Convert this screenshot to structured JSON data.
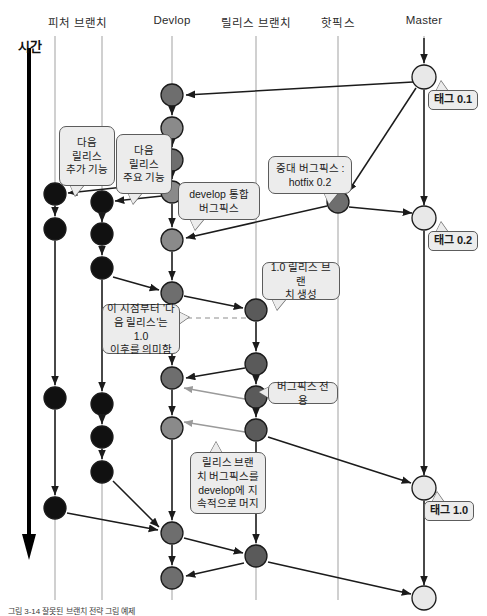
{
  "figure": {
    "caption": "그림 3-14 잘못된 브랜치 전략 그림 예제",
    "time_axis_label": "시간"
  },
  "lanes": [
    {
      "id": "feature",
      "label": "피처 브랜치",
      "x": 78,
      "label_x": 78,
      "line_x1": 55,
      "line_x2": 102
    },
    {
      "id": "develop",
      "label": "Devlop",
      "x": 172,
      "label_x": 172,
      "line_x1": 172,
      "line_x2": 172
    },
    {
      "id": "release",
      "label": "릴리스 브랜치",
      "x": 256,
      "label_x": 256,
      "line_x1": 256,
      "line_x2": 256
    },
    {
      "id": "hotfix",
      "label": "핫픽스",
      "x": 338,
      "label_x": 338,
      "line_x1": 338,
      "line_x2": 338
    },
    {
      "id": "master",
      "label": "Master",
      "x": 424,
      "label_x": 424,
      "line_x1": 424,
      "line_x2": 424
    }
  ],
  "lane_lines": [
    {
      "name": "lane-line-feature-a",
      "x": 55,
      "y1": 36,
      "y2": 600
    },
    {
      "name": "lane-line-feature-b",
      "x": 102,
      "y1": 36,
      "y2": 600
    },
    {
      "name": "lane-line-develop",
      "x": 172,
      "y1": 36,
      "y2": 600
    },
    {
      "name": "lane-line-release",
      "x": 256,
      "y1": 36,
      "y2": 600
    },
    {
      "name": "lane-line-hotfix",
      "x": 338,
      "y1": 36,
      "y2": 600
    },
    {
      "name": "lane-line-master",
      "x": 424,
      "y1": 36,
      "y2": 600
    }
  ],
  "colors": {
    "node_feature": "#111111",
    "node_develop": "#6e6e6e",
    "node_release": "#5a5a5a",
    "node_hotfix": "#6e6e6e",
    "node_master": "#e8e8e8",
    "edge": "#1b1b1b",
    "edge_light": "#9a9a9a",
    "lane_line": "#bcbcbc",
    "callout_bg": "#ececec",
    "callout_border": "#5c5c5c",
    "time_arrow": "#000000"
  },
  "nodes": [
    {
      "id": "f1",
      "lane": "feature",
      "x": 55,
      "y": 194,
      "r": 11,
      "fill": "#111111"
    },
    {
      "id": "f2",
      "lane": "feature",
      "x": 55,
      "y": 229,
      "r": 11,
      "fill": "#111111"
    },
    {
      "id": "f3",
      "lane": "feature",
      "x": 55,
      "y": 398,
      "r": 11,
      "fill": "#111111"
    },
    {
      "id": "f4",
      "lane": "feature",
      "x": 55,
      "y": 508,
      "r": 11,
      "fill": "#111111"
    },
    {
      "id": "g1",
      "lane": "feature",
      "x": 102,
      "y": 202,
      "r": 11,
      "fill": "#111111"
    },
    {
      "id": "g2",
      "lane": "feature",
      "x": 102,
      "y": 234,
      "r": 11,
      "fill": "#111111"
    },
    {
      "id": "g3",
      "lane": "feature",
      "x": 102,
      "y": 268,
      "r": 11,
      "fill": "#111111"
    },
    {
      "id": "g4",
      "lane": "feature",
      "x": 102,
      "y": 404,
      "r": 11,
      "fill": "#111111"
    },
    {
      "id": "g5",
      "lane": "feature",
      "x": 102,
      "y": 437,
      "r": 11,
      "fill": "#111111"
    },
    {
      "id": "g6",
      "lane": "feature",
      "x": 102,
      "y": 472,
      "r": 11,
      "fill": "#111111"
    },
    {
      "id": "d1",
      "lane": "develop",
      "x": 172,
      "y": 95,
      "r": 11,
      "fill": "#6e6e6e"
    },
    {
      "id": "d2",
      "lane": "develop",
      "x": 172,
      "y": 128,
      "r": 11,
      "fill": "#8a8a8a"
    },
    {
      "id": "d3",
      "lane": "develop",
      "x": 172,
      "y": 160,
      "r": 11,
      "fill": "#6e6e6e"
    },
    {
      "id": "d4",
      "lane": "develop",
      "x": 172,
      "y": 192,
      "r": 11,
      "fill": "#8a8a8a"
    },
    {
      "id": "d5",
      "lane": "develop",
      "x": 172,
      "y": 240,
      "r": 11,
      "fill": "#8a8a8a"
    },
    {
      "id": "d6",
      "lane": "develop",
      "x": 172,
      "y": 293,
      "r": 11,
      "fill": "#6e6e6e"
    },
    {
      "id": "d7",
      "lane": "develop",
      "x": 172,
      "y": 378,
      "r": 11,
      "fill": "#6e6e6e"
    },
    {
      "id": "d8",
      "lane": "develop",
      "x": 172,
      "y": 428,
      "r": 11,
      "fill": "#8a8a8a"
    },
    {
      "id": "d9",
      "lane": "develop",
      "x": 172,
      "y": 533,
      "r": 11,
      "fill": "#6e6e6e"
    },
    {
      "id": "d10",
      "lane": "develop",
      "x": 172,
      "y": 578,
      "r": 11,
      "fill": "#6e6e6e"
    },
    {
      "id": "r1",
      "lane": "release",
      "x": 256,
      "y": 310,
      "r": 11,
      "fill": "#5a5a5a"
    },
    {
      "id": "r2",
      "lane": "release",
      "x": 256,
      "y": 364,
      "r": 11,
      "fill": "#5a5a5a"
    },
    {
      "id": "r3",
      "lane": "release",
      "x": 256,
      "y": 397,
      "r": 11,
      "fill": "#5a5a5a"
    },
    {
      "id": "r4",
      "lane": "release",
      "x": 256,
      "y": 430,
      "r": 11,
      "fill": "#5a5a5a"
    },
    {
      "id": "r5",
      "lane": "release",
      "x": 256,
      "y": 556,
      "r": 11,
      "fill": "#5a5a5a"
    },
    {
      "id": "h1",
      "lane": "hotfix",
      "x": 338,
      "y": 202,
      "r": 11,
      "fill": "#6e6e6e"
    },
    {
      "id": "m1",
      "lane": "master",
      "x": 424,
      "y": 77,
      "r": 12,
      "fill": "#e8e8e8"
    },
    {
      "id": "m2",
      "lane": "master",
      "x": 424,
      "y": 218,
      "r": 12,
      "fill": "#e8e8e8"
    },
    {
      "id": "m3",
      "lane": "master",
      "x": 424,
      "y": 488,
      "r": 12,
      "fill": "#e8e8e8"
    },
    {
      "id": "m4",
      "lane": "master",
      "x": 424,
      "y": 598,
      "r": 12,
      "fill": "#e8e8e8"
    }
  ],
  "edges": [
    {
      "name": "edge-master-top-in",
      "x1": 424,
      "y1": 38,
      "x2": 424,
      "y2": 63,
      "style": "solid"
    },
    {
      "name": "edge-master-to-develop1",
      "x1": 413,
      "y1": 82,
      "x2": 186,
      "y2": 95,
      "style": "solid"
    },
    {
      "name": "edge-develop1-develop2",
      "x1": 172,
      "y1": 107,
      "x2": 172,
      "y2": 115,
      "style": "solid"
    },
    {
      "name": "edge-develop2-develop3",
      "x1": 172,
      "y1": 140,
      "x2": 172,
      "y2": 147,
      "style": "solid"
    },
    {
      "name": "edge-develop3-develop4",
      "x1": 172,
      "y1": 172,
      "x2": 172,
      "y2": 179,
      "style": "solid"
    },
    {
      "name": "edge-develop4-develop5",
      "x1": 172,
      "y1": 204,
      "x2": 172,
      "y2": 227,
      "style": "solid"
    },
    {
      "name": "edge-develop5-develop6",
      "x1": 172,
      "y1": 252,
      "x2": 172,
      "y2": 280,
      "style": "solid"
    },
    {
      "name": "edge-develop6-develop7",
      "x1": 172,
      "y1": 305,
      "x2": 172,
      "y2": 365,
      "style": "solid"
    },
    {
      "name": "edge-develop7-develop8",
      "x1": 172,
      "y1": 390,
      "x2": 172,
      "y2": 415,
      "style": "solid"
    },
    {
      "name": "edge-develop8-develop9",
      "x1": 172,
      "y1": 440,
      "x2": 172,
      "y2": 520,
      "style": "solid"
    },
    {
      "name": "edge-develop9-develop10",
      "x1": 172,
      "y1": 545,
      "x2": 172,
      "y2": 565,
      "style": "solid"
    },
    {
      "name": "edge-develop3-feature1",
      "x1": 161,
      "y1": 183,
      "x2": 68,
      "y2": 193,
      "style": "solid"
    },
    {
      "name": "edge-develop4-feature-g1",
      "x1": 162,
      "y1": 196,
      "x2": 115,
      "y2": 201,
      "style": "solid"
    },
    {
      "name": "edge-feature1-feature2",
      "x1": 55,
      "y1": 206,
      "x2": 55,
      "y2": 216,
      "style": "solid"
    },
    {
      "name": "edge-feature2-feature3",
      "x1": 55,
      "y1": 241,
      "x2": 55,
      "y2": 385,
      "style": "solid"
    },
    {
      "name": "edge-feature3-feature4",
      "x1": 55,
      "y1": 410,
      "x2": 55,
      "y2": 495,
      "style": "solid"
    },
    {
      "name": "edge-g1-g2",
      "x1": 102,
      "y1": 214,
      "x2": 102,
      "y2": 222,
      "style": "solid"
    },
    {
      "name": "edge-g2-g3",
      "x1": 102,
      "y1": 246,
      "x2": 102,
      "y2": 255,
      "style": "solid"
    },
    {
      "name": "edge-g3-develop6",
      "x1": 113,
      "y1": 277,
      "x2": 159,
      "y2": 290,
      "style": "solid"
    },
    {
      "name": "edge-g3-g4",
      "x1": 102,
      "y1": 280,
      "x2": 102,
      "y2": 391,
      "style": "solid"
    },
    {
      "name": "edge-g4-g5",
      "x1": 102,
      "y1": 416,
      "x2": 102,
      "y2": 424,
      "style": "solid"
    },
    {
      "name": "edge-g5-g6",
      "x1": 102,
      "y1": 449,
      "x2": 102,
      "y2": 459,
      "style": "solid"
    },
    {
      "name": "edge-g6-develop9",
      "x1": 113,
      "y1": 481,
      "x2": 159,
      "y2": 527,
      "style": "solid"
    },
    {
      "name": "edge-f4-develop9",
      "x1": 67,
      "y1": 513,
      "x2": 158,
      "y2": 530,
      "style": "solid"
    },
    {
      "name": "edge-master1-hotfix",
      "x1": 416,
      "y1": 88,
      "x2": 348,
      "y2": 192,
      "style": "solid"
    },
    {
      "name": "edge-hotfix-master2",
      "x1": 349,
      "y1": 207,
      "x2": 412,
      "y2": 213,
      "style": "solid"
    },
    {
      "name": "edge-hotfix-develop5",
      "x1": 327,
      "y1": 206,
      "x2": 186,
      "y2": 238,
      "style": "solid"
    },
    {
      "name": "edge-master1-master2",
      "x1": 424,
      "y1": 90,
      "x2": 424,
      "y2": 205,
      "style": "solid"
    },
    {
      "name": "edge-master2-master3",
      "x1": 424,
      "y1": 231,
      "x2": 424,
      "y2": 475,
      "style": "solid"
    },
    {
      "name": "edge-master3-master4",
      "x1": 424,
      "y1": 501,
      "x2": 424,
      "y2": 585,
      "style": "solid"
    },
    {
      "name": "edge-develop6-release1",
      "x1": 184,
      "y1": 296,
      "x2": 243,
      "y2": 308,
      "style": "solid"
    },
    {
      "name": "edge-release1-release2",
      "x1": 256,
      "y1": 322,
      "x2": 256,
      "y2": 351,
      "style": "solid"
    },
    {
      "name": "edge-release2-release3",
      "x1": 256,
      "y1": 376,
      "x2": 256,
      "y2": 384,
      "style": "solid"
    },
    {
      "name": "edge-release3-release4",
      "x1": 256,
      "y1": 409,
      "x2": 256,
      "y2": 417,
      "style": "solid"
    },
    {
      "name": "edge-release2-develop7",
      "x1": 245,
      "y1": 368,
      "x2": 186,
      "y2": 378,
      "style": "solid"
    },
    {
      "name": "edge-release3-develop",
      "x1": 245,
      "y1": 399,
      "x2": 184,
      "y2": 388,
      "style": "light"
    },
    {
      "name": "edge-release4-develop8",
      "x1": 245,
      "y1": 432,
      "x2": 184,
      "y2": 422,
      "style": "light"
    },
    {
      "name": "edge-release4-master3",
      "x1": 268,
      "y1": 437,
      "x2": 411,
      "y2": 483,
      "style": "solid"
    },
    {
      "name": "edge-release4-release5",
      "x1": 256,
      "y1": 442,
      "x2": 256,
      "y2": 543,
      "style": "solid"
    },
    {
      "name": "edge-develop9-release5",
      "x1": 184,
      "y1": 538,
      "x2": 243,
      "y2": 553,
      "style": "solid"
    },
    {
      "name": "edge-release5-develop10",
      "x1": 244,
      "y1": 563,
      "x2": 186,
      "y2": 576,
      "style": "solid"
    },
    {
      "name": "edge-release5-master4",
      "x1": 268,
      "y1": 562,
      "x2": 411,
      "y2": 594,
      "style": "solid"
    },
    {
      "name": "edge-dashed-marker",
      "x1": 178,
      "y1": 318,
      "x2": 256,
      "y2": 318,
      "style": "dashed"
    }
  ],
  "callouts": [
    {
      "id": "co-next-release-feature",
      "name": "callout-next-release-extra-feature",
      "text": "다음\n릴리스\n추가 기능",
      "x": 59,
      "y": 126,
      "w": 56,
      "h": 60,
      "tail_x": 70,
      "tail_y": 186,
      "tail_dir": "down"
    },
    {
      "id": "co-next-release-main",
      "name": "callout-next-release-main-feature",
      "text": "다음\n릴리스\n주요 기능",
      "x": 116,
      "y": 134,
      "w": 56,
      "h": 60,
      "tail_x": 128,
      "tail_y": 194,
      "tail_dir": "down"
    },
    {
      "id": "co-develop-integration",
      "name": "callout-develop-integration-bugfix",
      "text": "develop 통합\n버그픽스",
      "x": 178,
      "y": 182,
      "w": 82,
      "h": 38,
      "tail_x": 190,
      "tail_y": 220,
      "tail_dir": "down"
    },
    {
      "id": "co-hotfix",
      "name": "callout-critical-bugfix-hotfix",
      "text": "중대 버그픽스 :\nhotfix 0.2",
      "x": 268,
      "y": 156,
      "w": 84,
      "h": 38,
      "tail_x": 324,
      "tail_y": 194,
      "tail_dir": "down"
    },
    {
      "id": "co-release-create",
      "name": "callout-create-release-branch",
      "text": "1.0 릴리스 브랜\n치 생성",
      "x": 262,
      "y": 262,
      "w": 78,
      "h": 38,
      "tail_x": 272,
      "tail_y": 300,
      "tail_dir": "down"
    },
    {
      "id": "co-meaning",
      "name": "callout-next-release-meaning",
      "text": "이 시점부터 '다\n음 릴리스'는 1.0\n이후를 의미함",
      "x": 102,
      "y": 304,
      "w": 78,
      "h": 50,
      "tail_x": 180,
      "tail_y": 318,
      "tail_dir": "right"
    },
    {
      "id": "co-bugfix-only",
      "name": "callout-bugfix-only",
      "text": "버그픽스 전용",
      "x": 268,
      "y": 382,
      "w": 70,
      "h": 22,
      "tail_x": 268,
      "tail_y": 392,
      "tail_dir": "left"
    },
    {
      "id": "co-merge-back",
      "name": "callout-merge-release-bugfix-to-develop",
      "text": "릴리스 브랜\n치 버그픽스를\ndevelop에 지\n속적으로 머지",
      "x": 190,
      "y": 452,
      "w": 76,
      "h": 62,
      "tail_x": 210,
      "tail_y": 452,
      "tail_dir": "up"
    }
  ],
  "tags": [
    {
      "id": "tag-0-1",
      "name": "tag-label-0-1",
      "text": "태그 0.1",
      "x": 428,
      "y": 90,
      "w": 50,
      "h": 20,
      "tail_x": 436,
      "tail_y": 90
    },
    {
      "id": "tag-0-2",
      "name": "tag-label-0-2",
      "text": "태그 0.2",
      "x": 428,
      "y": 231,
      "w": 50,
      "h": 20,
      "tail_x": 436,
      "tail_y": 231
    },
    {
      "id": "tag-1-0",
      "name": "tag-label-1-0",
      "text": "태그 1.0",
      "x": 424,
      "y": 501,
      "w": 50,
      "h": 20,
      "tail_x": 432,
      "tail_y": 501
    }
  ]
}
